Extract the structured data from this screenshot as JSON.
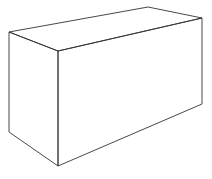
{
  "figure": {
    "stroke_color": "#333333",
    "background": "#ffffff",
    "vertices": {
      "top_back_left": [
        9,
        32
      ],
      "top_front_left": [
        58,
        51
      ],
      "top_front_right": [
        202,
        18
      ],
      "top_back_right": [
        148,
        7
      ],
      "bottom_back_left": [
        9,
        132
      ],
      "bottom_front_left": [
        58,
        166
      ],
      "bottom_front_right": [
        202,
        104
      ]
    }
  }
}
